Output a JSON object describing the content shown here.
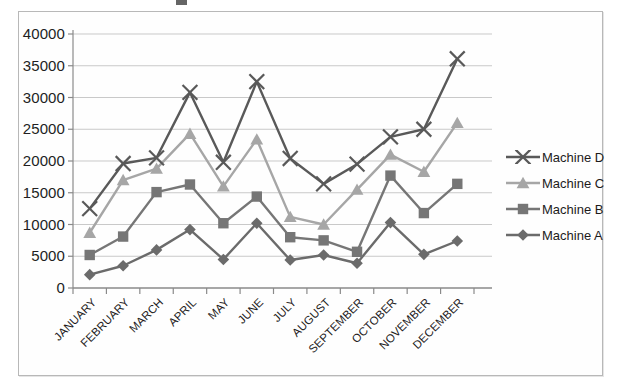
{
  "chart_data": {
    "type": "line",
    "title": "",
    "xlabel": "",
    "ylabel": "",
    "grid": true,
    "legend_position": "right",
    "ylim": [
      0,
      40000
    ],
    "ytick_step": 5000,
    "yticks": [
      "0",
      "5000",
      "10000",
      "15000",
      "20000",
      "25000",
      "30000",
      "35000",
      "40000"
    ],
    "categories": [
      "JANUARY",
      "FEBRUARY",
      "MARCH",
      "APRIL",
      "MAY",
      "JUNE",
      "JULY",
      "AUGUST",
      "SEPTEMBER",
      "OCTOBER",
      "NOVEMBER",
      "DECEMBER"
    ],
    "series": [
      {
        "name": "Machine D",
        "marker": "x-cross",
        "color": "#595959",
        "values": [
          12500,
          19600,
          20500,
          30800,
          19800,
          32500,
          20400,
          16400,
          19500,
          23800,
          25000,
          36100
        ]
      },
      {
        "name": "Machine C",
        "marker": "triangle",
        "color": "#a6a6a6",
        "values": [
          8700,
          17000,
          18800,
          24300,
          16000,
          23400,
          11200,
          10000,
          15500,
          21000,
          18300,
          26000
        ]
      },
      {
        "name": "Machine B",
        "marker": "square",
        "color": "#767676",
        "values": [
          5200,
          8100,
          15100,
          16300,
          10200,
          14400,
          8000,
          7500,
          5700,
          17700,
          11800,
          16400
        ]
      },
      {
        "name": "Machine A",
        "marker": "diamond",
        "color": "#6b6b6b",
        "values": [
          2100,
          3500,
          6000,
          9200,
          4500,
          10200,
          4400,
          5200,
          3900,
          10300,
          5300,
          7400
        ]
      }
    ]
  },
  "legend": {
    "items": [
      {
        "label": "Machine D"
      },
      {
        "label": "Machine C"
      },
      {
        "label": "Machine B"
      },
      {
        "label": "Machine A"
      }
    ]
  }
}
